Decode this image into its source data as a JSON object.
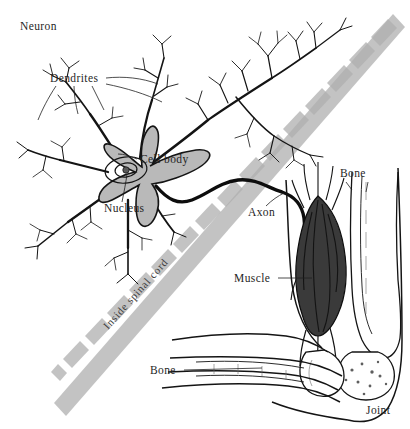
{
  "figure": {
    "background_color": "#ffffff",
    "ink_color": "#141414",
    "band_color": "#c3c3c3",
    "soma_fill": "#b9b9b9",
    "muscle_fill": "#3a3a3a"
  },
  "labels": {
    "neuron": "Neuron",
    "dendrites": "Dendrites",
    "cell_body": "Cell body",
    "nucleus": "Nucleus",
    "axon": "Axon",
    "muscle": "Muscle",
    "bone_upper": "Bone",
    "bone_lower": "Bone",
    "joint": "Joint",
    "inside_spinal_cord": "Inside spinal cord"
  },
  "diagram_parts": [
    {
      "name": "neuron",
      "region": "upper-left",
      "description": "Branching nerve cell with gray soma, nucleus and many dendrites"
    },
    {
      "name": "dendrites",
      "region": "upper-left",
      "description": "Tree-like branching extensions radiating from the cell body"
    },
    {
      "name": "cell-body",
      "region": "center-left",
      "description": "Gray shaded soma"
    },
    {
      "name": "nucleus",
      "region": "center-left",
      "description": "Oval inside the cell body"
    },
    {
      "name": "axon",
      "region": "center",
      "description": "Thick black fiber running from the cell body across the spinal cord boundary to the muscle"
    },
    {
      "name": "inside-spinal-cord-band",
      "region": "diagonal",
      "description": "Gray diagonal band separating inside spinal cord from the limb"
    },
    {
      "name": "muscle",
      "region": "right",
      "description": "Dark spindle shaped muscle attached to the upper arm bone"
    },
    {
      "name": "bone-upper",
      "region": "right",
      "description": "Upper arm bone (humerus)"
    },
    {
      "name": "bone-lower",
      "region": "lower-right",
      "description": "Forearm bones"
    },
    {
      "name": "joint",
      "region": "lower-right",
      "description": "Elbow joint where the bones meet"
    }
  ]
}
